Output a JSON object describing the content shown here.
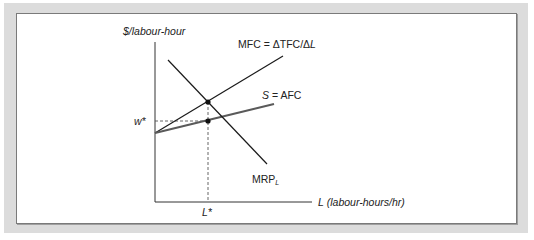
{
  "figure": {
    "y_axis_label": "$/labour-hour",
    "x_axis_label_var": "L",
    "x_axis_label_unit": "(labour-hours/hr)",
    "w_star_label": "w*",
    "l_star_label": "L*",
    "curves": {
      "mfc": {
        "label": "MFC = ΔTFC/Δ",
        "label_var": "L",
        "color": "#1a1a1a"
      },
      "supply": {
        "label_var": "S",
        "label": " = AFC",
        "color": "#5a5a5a"
      },
      "mrp": {
        "label": "MRP",
        "subscript": "L",
        "color": "#1a1a1a"
      }
    },
    "colors": {
      "background_frame": "#dcdcdc",
      "panel": "#ffffff",
      "axis": "#333333",
      "dashed": "#555555"
    }
  }
}
